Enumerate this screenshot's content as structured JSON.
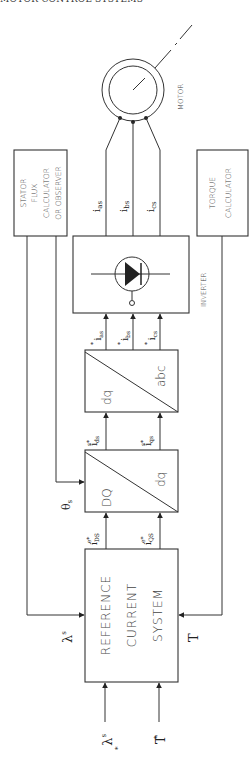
{
  "header": {
    "running_title": "MOTOR CONTROL SYSTEMS"
  },
  "blocks": {
    "motor": {
      "label": "MOTOR"
    },
    "stator_flux": {
      "lines": [
        "STATOR",
        "FLUX",
        "CALCULATOR",
        "OR OBSERVER"
      ]
    },
    "torque_calc": {
      "lines": [
        "TORQUE",
        "CALCULATOR"
      ]
    },
    "inverter": {
      "label": "INVERTER"
    },
    "dq_abc": {
      "in_label": "dq",
      "out_label": "abc"
    },
    "DQ_dq": {
      "in_label": "DQ",
      "out_label": "dq"
    },
    "reference": {
      "lines": [
        "REFERENCE",
        "CURRENT",
        "SYSTEM"
      ]
    }
  },
  "signals": {
    "motor_currents": [
      "i_as",
      "i_bs",
      "i_cs"
    ],
    "motor_current_subs": [
      "as",
      "bs",
      "cs"
    ],
    "phase_refs": [
      "i*_as",
      "i*_bs",
      "i*_cs"
    ],
    "phase_ref_subs": [
      "as",
      "bs",
      "cs"
    ],
    "stator_refs": [
      "i^s*_ds",
      "i^s*_qs"
    ],
    "stator_ref_subs": [
      "ds",
      "qs"
    ],
    "sync_refs": [
      "i^e*_DS",
      "i^e*_QS"
    ],
    "sync_ref_subs": [
      "DS",
      "QS"
    ],
    "theta": "θs",
    "lambda_fb": "λs",
    "torque_fb": "T",
    "lambda_cmd": "λ*s",
    "torque_cmd": "T*",
    "i": "i",
    "star": "*",
    "s": "s",
    "lambda": "λ",
    "theta_sym": "θ",
    "T": "T"
  }
}
